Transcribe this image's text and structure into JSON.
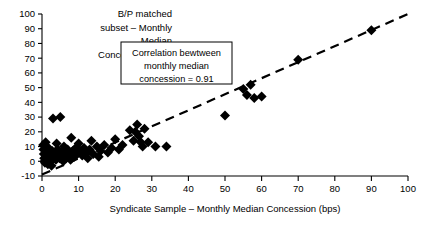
{
  "chart_data": {
    "type": "scatter",
    "title": "",
    "xlabel": "Syndicate Sample – Monthly Median Concession (bps)",
    "ylabel_lines": [
      "B/P matched",
      "subset – Monthly",
      "Median",
      "Concession (bps)"
    ],
    "ylabel": "B/P matched subset – Monthly Median Concession (bps)",
    "xlim": [
      0,
      100
    ],
    "ylim": [
      -10,
      100
    ],
    "xticks": [
      0,
      10,
      20,
      30,
      40,
      50,
      60,
      70,
      80,
      90,
      100
    ],
    "yticks": [
      -10,
      0,
      10,
      20,
      30,
      40,
      50,
      60,
      70,
      80,
      90,
      100
    ],
    "grid": false,
    "legend": "none",
    "annotation": {
      "lines": [
        "Correlation bewtween",
        "monthly median",
        "concession = 0.91"
      ],
      "correlation": 0.91
    },
    "trendline": {
      "type": "linear",
      "style": "dashed",
      "x": [
        0,
        100
      ],
      "y": [
        -9,
        100
      ]
    },
    "marker": {
      "shape": "diamond",
      "color": "#000000",
      "size": 5
    },
    "points": [
      {
        "x": 0.3,
        "y": 11
      },
      {
        "x": 0.4,
        "y": 8
      },
      {
        "x": 0.5,
        "y": 5
      },
      {
        "x": 0.6,
        "y": 2
      },
      {
        "x": 0.7,
        "y": 0
      },
      {
        "x": 0.8,
        "y": -1
      },
      {
        "x": 1.0,
        "y": 13
      },
      {
        "x": 1.1,
        "y": 6
      },
      {
        "x": 1.2,
        "y": 3
      },
      {
        "x": 1.4,
        "y": 1
      },
      {
        "x": 1.6,
        "y": -2
      },
      {
        "x": 1.8,
        "y": 9
      },
      {
        "x": 2.0,
        "y": 4
      },
      {
        "x": 2.2,
        "y": 2
      },
      {
        "x": 2.4,
        "y": 0
      },
      {
        "x": 2.6,
        "y": -3
      },
      {
        "x": 2.8,
        "y": 7
      },
      {
        "x": 3.0,
        "y": 29
      },
      {
        "x": 3.2,
        "y": 5
      },
      {
        "x": 3.5,
        "y": 3
      },
      {
        "x": 3.8,
        "y": 1
      },
      {
        "x": 4.0,
        "y": 12
      },
      {
        "x": 4.2,
        "y": 8
      },
      {
        "x": 4.5,
        "y": 4
      },
      {
        "x": 4.8,
        "y": 2
      },
      {
        "x": 5.0,
        "y": 30
      },
      {
        "x": 5.2,
        "y": 6
      },
      {
        "x": 5.5,
        "y": 3
      },
      {
        "x": 5.8,
        "y": 0
      },
      {
        "x": 6.0,
        "y": 10
      },
      {
        "x": 6.3,
        "y": 5
      },
      {
        "x": 6.6,
        "y": 2
      },
      {
        "x": 7.0,
        "y": 8
      },
      {
        "x": 7.4,
        "y": 4
      },
      {
        "x": 7.8,
        "y": 1
      },
      {
        "x": 8.0,
        "y": 16
      },
      {
        "x": 8.4,
        "y": 7
      },
      {
        "x": 8.8,
        "y": 3
      },
      {
        "x": 9.2,
        "y": 9
      },
      {
        "x": 9.6,
        "y": 5
      },
      {
        "x": 10.0,
        "y": 12
      },
      {
        "x": 10.5,
        "y": 7
      },
      {
        "x": 11.0,
        "y": 4
      },
      {
        "x": 11.5,
        "y": 9
      },
      {
        "x": 12.0,
        "y": 6
      },
      {
        "x": 12.5,
        "y": 2
      },
      {
        "x": 13.0,
        "y": 8
      },
      {
        "x": 13.5,
        "y": 14
      },
      {
        "x": 14.0,
        "y": 5
      },
      {
        "x": 15.0,
        "y": 10
      },
      {
        "x": 15.5,
        "y": 3
      },
      {
        "x": 16.0,
        "y": 7
      },
      {
        "x": 17.0,
        "y": 11
      },
      {
        "x": 18.0,
        "y": 6
      },
      {
        "x": 19.0,
        "y": 9
      },
      {
        "x": 20.0,
        "y": 15
      },
      {
        "x": 21.0,
        "y": 8
      },
      {
        "x": 22.0,
        "y": 11
      },
      {
        "x": 24.0,
        "y": 21
      },
      {
        "x": 25.0,
        "y": 14
      },
      {
        "x": 25.5,
        "y": 20
      },
      {
        "x": 26.0,
        "y": 25
      },
      {
        "x": 26.5,
        "y": 17
      },
      {
        "x": 27.0,
        "y": 13
      },
      {
        "x": 27.5,
        "y": 10
      },
      {
        "x": 28.0,
        "y": 22
      },
      {
        "x": 29.0,
        "y": 13
      },
      {
        "x": 31.0,
        "y": 10
      },
      {
        "x": 34.0,
        "y": 10
      },
      {
        "x": 50.0,
        "y": 31
      },
      {
        "x": 55.0,
        "y": 49
      },
      {
        "x": 56.0,
        "y": 45
      },
      {
        "x": 57.0,
        "y": 52
      },
      {
        "x": 58.0,
        "y": 43
      },
      {
        "x": 60.0,
        "y": 44
      },
      {
        "x": 70.0,
        "y": 69
      },
      {
        "x": 90.0,
        "y": 89
      }
    ]
  }
}
